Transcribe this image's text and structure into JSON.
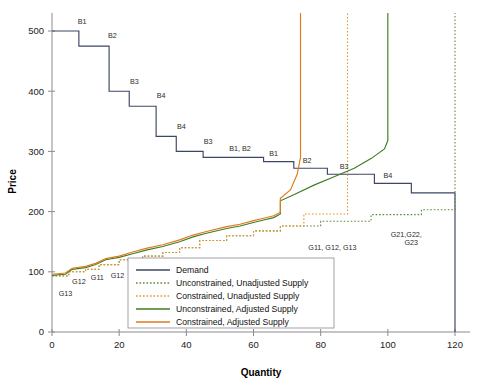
{
  "chart_data": {
    "type": "line",
    "title": "",
    "xlabel": "Quantity",
    "ylabel": "Price",
    "xlim": [
      0,
      126
    ],
    "ylim": [
      0,
      530
    ],
    "xticks": [
      0,
      20,
      40,
      60,
      80,
      100,
      120
    ],
    "yticks": [
      0,
      100,
      200,
      300,
      400,
      500
    ],
    "grid": false,
    "legend_position": "lower-center",
    "series": [
      {
        "name": "Demand",
        "style": "solid",
        "color": "#3d4664",
        "shape": "step",
        "points": [
          [
            0,
            500
          ],
          [
            8,
            500
          ],
          [
            8,
            475
          ],
          [
            17,
            475
          ],
          [
            17,
            400
          ],
          [
            23,
            400
          ],
          [
            23,
            375
          ],
          [
            31,
            375
          ],
          [
            31,
            325
          ],
          [
            37,
            325
          ],
          [
            37,
            300
          ],
          [
            45,
            300
          ],
          [
            45,
            290
          ],
          [
            63,
            290
          ],
          [
            63,
            283
          ],
          [
            72,
            283
          ],
          [
            72,
            272
          ],
          [
            82,
            272
          ],
          [
            82,
            262
          ],
          [
            96,
            262
          ],
          [
            96,
            247
          ],
          [
            107,
            247
          ],
          [
            107,
            231
          ],
          [
            120,
            231
          ],
          [
            120,
            0
          ]
        ]
      },
      {
        "name": "Unconstrained, Unadjusted Supply",
        "style": "dotted",
        "color": "#5f8a3c",
        "shape": "step",
        "points": [
          [
            0,
            93
          ],
          [
            5,
            93
          ],
          [
            5,
            100
          ],
          [
            10,
            100
          ],
          [
            10,
            104
          ],
          [
            14,
            104
          ],
          [
            14,
            112
          ],
          [
            20,
            112
          ],
          [
            20,
            120
          ],
          [
            27,
            120
          ],
          [
            27,
            126
          ],
          [
            33,
            126
          ],
          [
            33,
            132
          ],
          [
            38,
            132
          ],
          [
            38,
            140
          ],
          [
            44,
            140
          ],
          [
            44,
            152
          ],
          [
            52,
            152
          ],
          [
            52,
            160
          ],
          [
            60,
            160
          ],
          [
            60,
            168
          ],
          [
            68,
            168
          ],
          [
            68,
            176
          ],
          [
            80,
            176
          ],
          [
            80,
            184
          ],
          [
            95,
            184
          ],
          [
            95,
            195
          ],
          [
            110,
            195
          ],
          [
            110,
            203
          ],
          [
            120,
            203
          ],
          [
            120,
            530
          ]
        ]
      },
      {
        "name": "Constrained, Unadjusted Supply",
        "style": "dotted",
        "color": "#e8942e",
        "shape": "step",
        "points": [
          [
            0,
            93
          ],
          [
            5,
            93
          ],
          [
            5,
            100
          ],
          [
            10,
            100
          ],
          [
            10,
            104
          ],
          [
            14,
            104
          ],
          [
            14,
            112
          ],
          [
            20,
            112
          ],
          [
            20,
            120
          ],
          [
            27,
            120
          ],
          [
            27,
            126
          ],
          [
            33,
            126
          ],
          [
            33,
            132
          ],
          [
            38,
            132
          ],
          [
            38,
            140
          ],
          [
            44,
            140
          ],
          [
            44,
            152
          ],
          [
            52,
            152
          ],
          [
            52,
            160
          ],
          [
            60,
            160
          ],
          [
            60,
            168
          ],
          [
            68,
            168
          ],
          [
            68,
            176
          ],
          [
            75,
            176
          ],
          [
            75,
            196
          ],
          [
            88,
            196
          ],
          [
            88,
            530
          ]
        ]
      },
      {
        "name": "Unconstrained, Adjusted Supply",
        "style": "solid",
        "color": "#3f7d22",
        "shape": "line",
        "points": [
          [
            0,
            94
          ],
          [
            4,
            96
          ],
          [
            6,
            104
          ],
          [
            10,
            107
          ],
          [
            13,
            112
          ],
          [
            16,
            120
          ],
          [
            20,
            124
          ],
          [
            24,
            130
          ],
          [
            28,
            136
          ],
          [
            33,
            142
          ],
          [
            38,
            150
          ],
          [
            42,
            158
          ],
          [
            46,
            164
          ],
          [
            52,
            172
          ],
          [
            56,
            176
          ],
          [
            60,
            182
          ],
          [
            63,
            186
          ],
          [
            66,
            190
          ],
          [
            68,
            196
          ],
          [
            68,
            218
          ],
          [
            72,
            228
          ],
          [
            78,
            244
          ],
          [
            84,
            258
          ],
          [
            90,
            272
          ],
          [
            95,
            288
          ],
          [
            99,
            304
          ],
          [
            100,
            318
          ],
          [
            100,
            530
          ]
        ]
      },
      {
        "name": "Constrained, Adjusted Supply",
        "style": "solid",
        "color": "#e07a1f",
        "shape": "line",
        "points": [
          [
            0,
            96
          ],
          [
            4,
            98
          ],
          [
            6,
            106
          ],
          [
            10,
            109
          ],
          [
            13,
            114
          ],
          [
            16,
            122
          ],
          [
            20,
            126
          ],
          [
            24,
            133
          ],
          [
            28,
            139
          ],
          [
            33,
            145
          ],
          [
            38,
            153
          ],
          [
            42,
            161
          ],
          [
            46,
            167
          ],
          [
            52,
            175
          ],
          [
            56,
            179
          ],
          [
            60,
            185
          ],
          [
            63,
            189
          ],
          [
            66,
            193
          ],
          [
            68,
            199
          ],
          [
            68,
            222
          ],
          [
            71,
            236
          ],
          [
            73,
            262
          ],
          [
            74,
            290
          ],
          [
            74,
            530
          ]
        ]
      }
    ],
    "annotations": [
      {
        "text": "B1",
        "x": 9,
        "y": 512
      },
      {
        "text": "B2",
        "x": 18,
        "y": 488
      },
      {
        "text": "B3",
        "x": 24.5,
        "y": 412
      },
      {
        "text": "B4",
        "x": 32.5,
        "y": 388
      },
      {
        "text": "B4",
        "x": 38.5,
        "y": 338
      },
      {
        "text": "B3",
        "x": 46.5,
        "y": 312
      },
      {
        "text": "B1, B2",
        "x": 56,
        "y": 300
      },
      {
        "text": "B1",
        "x": 66,
        "y": 292
      },
      {
        "text": "B2",
        "x": 76,
        "y": 281
      },
      {
        "text": "B3",
        "x": 87,
        "y": 271
      },
      {
        "text": "B4",
        "x": 100,
        "y": 256
      },
      {
        "text": "G13",
        "x": 4,
        "y": 60
      },
      {
        "text": "G12",
        "x": 8,
        "y": 80
      },
      {
        "text": "G11",
        "x": 13.5,
        "y": 86
      },
      {
        "text": "G12",
        "x": 19.5,
        "y": 90
      },
      {
        "text": "G13,",
        "x": 29,
        "y": 88
      },
      {
        "text": "G22",
        "x": 29.5,
        "y": 74
      },
      {
        "text": "G23",
        "x": 38,
        "y": 92
      },
      {
        "text": "G21",
        "x": 44,
        "y": 100
      },
      {
        "text": "G21, G22",
        "x": 53,
        "y": 103
      },
      {
        "text": "G23",
        "x": 72.5,
        "y": 112
      },
      {
        "text": "G11, G12, G13",
        "x": 83.5,
        "y": 137
      },
      {
        "text": "G21,G22,",
        "x": 105.5,
        "y": 158
      },
      {
        "text": "G23",
        "x": 107,
        "y": 144
      }
    ]
  },
  "legend": {
    "items": [
      {
        "label": "Demand",
        "color": "#3d4664",
        "dash": "solid"
      },
      {
        "label": "Unconstrained, Unadjusted Supply",
        "color": "#5f8a3c",
        "dash": "dotted"
      },
      {
        "label": "Constrained, Unadjusted Supply",
        "color": "#e8942e",
        "dash": "dotted"
      },
      {
        "label": "Unconstrained, Adjusted Supply",
        "color": "#3f7d22",
        "dash": "solid"
      },
      {
        "label": "Constrained, Adjusted Supply",
        "color": "#e07a1f",
        "dash": "solid"
      }
    ]
  }
}
